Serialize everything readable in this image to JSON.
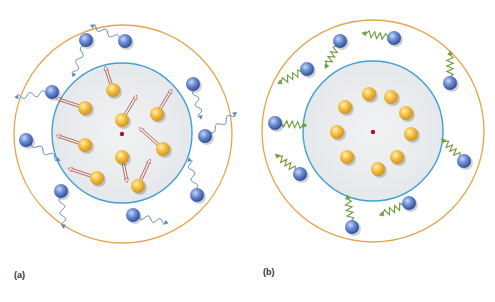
{
  "figure": {
    "panels": [
      {
        "id": "a",
        "label": "(a)",
        "label_pos": [
          14,
          270
        ],
        "outer_circle": {
          "cx": 123,
          "cy": 134,
          "r": 109,
          "color": "#e3a64a"
        },
        "inner_circle": {
          "cx": 122,
          "cy": 133,
          "r": 70,
          "stroke": "#3fa0d4",
          "fill": "#eceef0"
        },
        "center_dot": {
          "cx": 122,
          "cy": 134,
          "color": "#b01818"
        },
        "inner_particles": [
          {
            "x": 113,
            "y": 90,
            "arrow_dx": -6,
            "arrow_dy": -18
          },
          {
            "x": 85,
            "y": 108,
            "arrow_dx": -24,
            "arrow_dy": -8
          },
          {
            "x": 122,
            "y": 120,
            "arrow_dx": 12,
            "arrow_dy": -20
          },
          {
            "x": 157,
            "y": 114,
            "arrow_dx": 12,
            "arrow_dy": -20
          },
          {
            "x": 85,
            "y": 145,
            "arrow_dx": -24,
            "arrow_dy": -8
          },
          {
            "x": 163,
            "y": 149,
            "arrow_dx": -20,
            "arrow_dy": -18
          },
          {
            "x": 122,
            "y": 157,
            "arrow_dx": 4,
            "arrow_dy": 20
          },
          {
            "x": 97,
            "y": 178,
            "arrow_dx": -24,
            "arrow_dy": -8
          },
          {
            "x": 138,
            "y": 186,
            "arrow_dx": 10,
            "arrow_dy": -22
          }
        ],
        "outer_particles": [
          {
            "x": 86,
            "y": 40,
            "wave_dx": -10,
            "wave_dy": 28
          },
          {
            "x": 125,
            "y": 41,
            "wave_dx": -26,
            "wave_dy": -12
          },
          {
            "x": 52,
            "y": 92,
            "wave_dx": -28,
            "wave_dy": 4
          },
          {
            "x": 193,
            "y": 84,
            "wave_dx": 6,
            "wave_dy": 26
          },
          {
            "x": 26,
            "y": 140,
            "wave_dx": 26,
            "wave_dy": 16
          },
          {
            "x": 205,
            "y": 136,
            "wave_dx": 24,
            "wave_dy": -18
          },
          {
            "x": 61,
            "y": 191,
            "wave_dx": 2,
            "wave_dy": 28
          },
          {
            "x": 197,
            "y": 195,
            "wave_dx": -6,
            "wave_dy": -28
          },
          {
            "x": 133,
            "y": 215,
            "wave_dx": 26,
            "wave_dy": 6
          }
        ],
        "inner_particle_color": "#f2b632",
        "outer_particle_color": "#4f74c4",
        "arrow_color": "#a64a3c",
        "wave_color": "#5a86b4"
      },
      {
        "id": "b",
        "label": "(b)",
        "label_pos": [
          263,
          267
        ],
        "outer_circle": {
          "cx": 373,
          "cy": 131,
          "r": 111,
          "color": "#e3a64a"
        },
        "inner_circle": {
          "cx": 373,
          "cy": 131,
          "r": 70,
          "stroke": "#3fa0d4",
          "fill": "#eceef0"
        },
        "center_dot": {
          "cx": 373,
          "cy": 132,
          "color": "#b01818"
        },
        "inner_particles": [
          {
            "x": 369,
            "y": 94
          },
          {
            "x": 391,
            "y": 97
          },
          {
            "x": 406,
            "y": 113
          },
          {
            "x": 411,
            "y": 134
          },
          {
            "x": 397,
            "y": 157
          },
          {
            "x": 378,
            "y": 169
          },
          {
            "x": 347,
            "y": 157
          },
          {
            "x": 337,
            "y": 132
          },
          {
            "x": 345,
            "y": 107
          }
        ],
        "outer_particles": [
          {
            "x": 340,
            "y": 41,
            "spring_dx": -12,
            "spring_dy": 22
          },
          {
            "x": 307,
            "y": 69,
            "spring_dx": -24,
            "spring_dy": 12
          },
          {
            "x": 275,
            "y": 123,
            "spring_dx": 26,
            "spring_dy": 2
          },
          {
            "x": 300,
            "y": 174,
            "spring_dx": -20,
            "spring_dy": -16
          },
          {
            "x": 394,
            "y": 38,
            "spring_dx": -26,
            "spring_dy": -4
          },
          {
            "x": 450,
            "y": 83,
            "spring_dx": 0,
            "spring_dy": -26
          },
          {
            "x": 464,
            "y": 161,
            "spring_dx": -18,
            "spring_dy": -18
          },
          {
            "x": 409,
            "y": 203,
            "spring_dx": -24,
            "spring_dy": 10
          },
          {
            "x": 352,
            "y": 227,
            "spring_dx": -4,
            "spring_dy": -26
          }
        ],
        "inner_particle_color": "#f2b632",
        "outer_particle_color": "#4f74c4",
        "spring_color": "#6f9a3c"
      }
    ]
  }
}
